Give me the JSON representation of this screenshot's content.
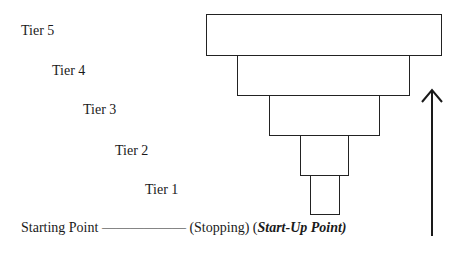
{
  "tiers": [
    {
      "label": "Tier 5"
    },
    {
      "label": "Tier 4"
    },
    {
      "label": "Tier 3"
    },
    {
      "label": "Tier 2"
    },
    {
      "label": "Tier 1"
    }
  ],
  "caption": {
    "start": "Starting Point",
    "dashes": "——————",
    "stopping": "(Stopping)",
    "startup_open": "(",
    "startup": "Start-Up Point)"
  },
  "arrow": {
    "direction": "up",
    "icon": "up-arrow-icon"
  }
}
